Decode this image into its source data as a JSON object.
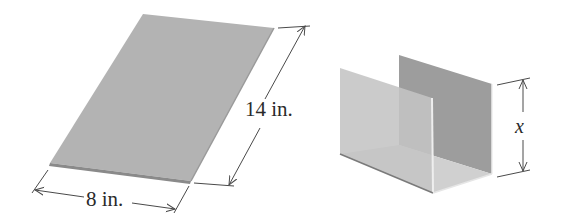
{
  "figure": {
    "sheet": {
      "description": "Flat rectangular sheet of metal",
      "width_label": "8 in.",
      "length_label": "14 in."
    },
    "channel": {
      "description": "Sheet bent into a U-shaped channel (rain gutter) with equal side heights",
      "height_label": "x"
    }
  },
  "colors": {
    "sheet_fill": "#b3b3b3",
    "sheet_edge": "#8a8a8a",
    "channel_front": "#c4c4c4",
    "channel_back": "#9d9d9d",
    "channel_floor": "#d0d0d0",
    "dimension_line": "#4a4a4a"
  }
}
